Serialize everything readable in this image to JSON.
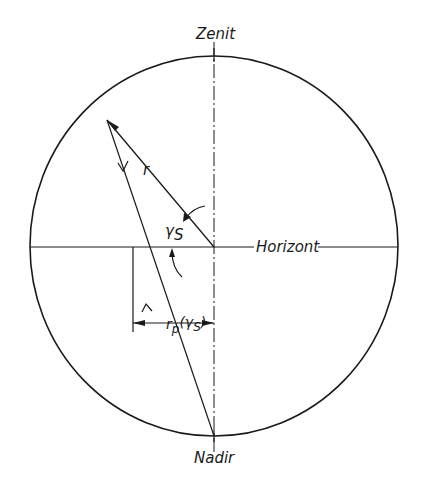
{
  "diagram": {
    "labels": {
      "zenith": "Zenit",
      "nadir": "Nadir",
      "horizon": "Horizont",
      "radius": "r",
      "angle": "γS",
      "angle_main": "γ",
      "angle_sub": "S",
      "projection": "rp(γS)",
      "projection_main": "r",
      "projection_sub": "p",
      "projection_arg": "(γ",
      "projection_arg_sub": "S",
      "projection_close": ")"
    },
    "colors": {
      "stroke": "#1a1a1a",
      "background": "#ffffff"
    }
  }
}
